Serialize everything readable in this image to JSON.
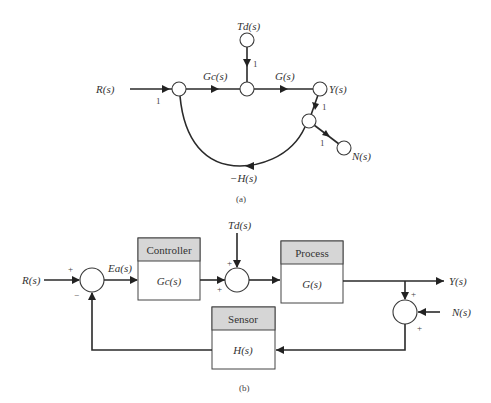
{
  "signal_flow_graph": {
    "caption": "(a)",
    "inputs": {
      "R": "R(s)",
      "Td": "Td(s)",
      "N": "N(s)"
    },
    "output": "Y(s)",
    "branches": {
      "R_gain": "1",
      "Gc": "Gc(s)",
      "G": "G(s)",
      "Td_gain": "1",
      "Y_gain": "1",
      "N_gain": "1",
      "feedback": "−H(s)"
    }
  },
  "block_diagram": {
    "caption": "(b)",
    "input": "R(s)",
    "error": "Ea(s)",
    "disturbance": "Td(s)",
    "output": "Y(s)",
    "noise": "N(s)",
    "blocks": [
      {
        "header": "Controller",
        "tf": "Gc(s)"
      },
      {
        "header": "Process",
        "tf": "G(s)"
      },
      {
        "header": "Sensor",
        "tf": "H(s)"
      }
    ],
    "signs": {
      "sum1_top": "+",
      "sum1_bottom": "−",
      "sum2_top": "+",
      "sum2_left": "+",
      "sum3_top": "+",
      "sum3_right": "+"
    }
  }
}
